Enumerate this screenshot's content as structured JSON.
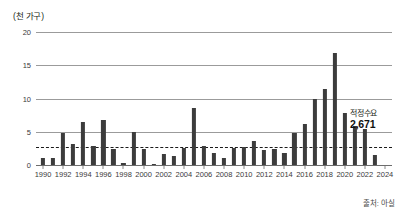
{
  "chart_data": {
    "type": "bar",
    "title": "",
    "subtitle": "",
    "xlabel": "",
    "ylabel": "(천 가구)",
    "ylim": [
      0,
      20
    ],
    "yticks": [
      0,
      5,
      10,
      15,
      20
    ],
    "ytick_labels": [
      "0",
      "5",
      "10",
      "15",
      "20"
    ],
    "xlim": [
      1989.3,
      2024.7
    ],
    "xticks": [
      1990,
      1992,
      1994,
      1996,
      1998,
      2000,
      2002,
      2004,
      2006,
      2008,
      2010,
      2012,
      2014,
      2016,
      2018,
      2020,
      2022,
      2024
    ],
    "xtick_labels": [
      "1990",
      "1992",
      "1994",
      "1996",
      "1998",
      "2000",
      "2002",
      "2004",
      "2006",
      "2008",
      "2010",
      "2012",
      "2014",
      "2016",
      "2018",
      "2020",
      "2022",
      "2024"
    ],
    "grid": true,
    "legend": null,
    "bar_color": "#3c3c3c",
    "categories": [
      "1990",
      "1991",
      "1992",
      "1993",
      "1994",
      "1995",
      "1996",
      "1997",
      "1998",
      "1999",
      "2000",
      "2001",
      "2002",
      "2003",
      "2004",
      "2005",
      "2006",
      "2007",
      "2008",
      "2009",
      "2010",
      "2011",
      "2012",
      "2013",
      "2014",
      "2015",
      "2016",
      "2017",
      "2018",
      "2019",
      "2020",
      "2021",
      "2022",
      "2023"
    ],
    "values": [
      1.1,
      1.1,
      4.8,
      3.2,
      6.4,
      2.9,
      6.8,
      2.4,
      0.3,
      4.9,
      2.4,
      0.2,
      1.7,
      1.4,
      2.5,
      8.5,
      2.8,
      1.8,
      1.0,
      2.5,
      2.7,
      3.6,
      2.3,
      2.4,
      1.8,
      4.8,
      6.1,
      10.0,
      11.5,
      16.9,
      7.8,
      5.9,
      5.4,
      1.5
    ],
    "annotations": [
      {
        "name": "optimal-demand",
        "label": "적정수요",
        "value_label": "2,671",
        "value": 2.671,
        "line_style": "dashed",
        "line_color": "#1a1a1a"
      }
    ],
    "source": "출처: 아실"
  }
}
